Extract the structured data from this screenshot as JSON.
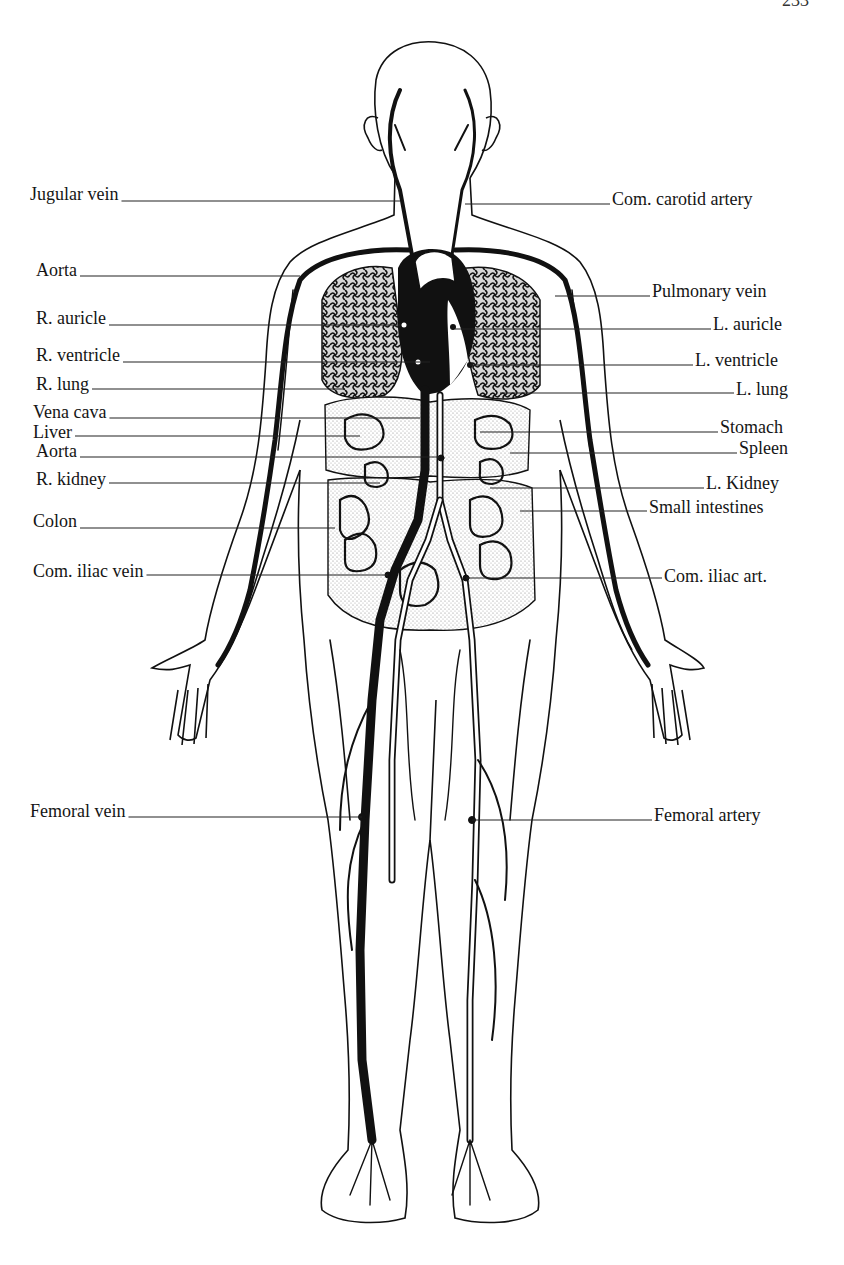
{
  "page": {
    "page_number_partial": "233"
  },
  "diagram": {
    "labels_left": [
      {
        "id": "jugular-vein",
        "text": "Jugular vein",
        "x": 30,
        "y": 184,
        "line_y": 201,
        "line_end_x": 400
      },
      {
        "id": "aorta-upper",
        "text": "Aorta",
        "x": 36,
        "y": 260,
        "line_y": 276,
        "line_end_x": 300
      },
      {
        "id": "r-auricle",
        "text": "R. auricle",
        "x": 36,
        "y": 308,
        "line_y": 325,
        "line_end_x": 400
      },
      {
        "id": "r-ventricle",
        "text": "R. ventricle",
        "x": 36,
        "y": 345,
        "line_y": 362,
        "line_end_x": 430
      },
      {
        "id": "r-lung",
        "text": "R. lung",
        "x": 36,
        "y": 374,
        "line_y": 389,
        "line_end_x": 345
      },
      {
        "id": "vena-cava",
        "text": "Vena cava",
        "x": 33,
        "y": 402,
        "line_y": 418,
        "line_end_x": 420
      },
      {
        "id": "liver",
        "text": "Liver",
        "x": 33,
        "y": 422,
        "line_y": 436,
        "line_end_x": 360
      },
      {
        "id": "aorta-lower",
        "text": "Aorta",
        "x": 36,
        "y": 441,
        "line_y": 457,
        "line_end_x": 440
      },
      {
        "id": "r-kidney",
        "text": "R. kidney",
        "x": 36,
        "y": 469,
        "line_y": 483,
        "line_end_x": 380
      },
      {
        "id": "colon",
        "text": "Colon",
        "x": 33,
        "y": 511,
        "line_y": 528,
        "line_end_x": 335
      },
      {
        "id": "com-iliac-vein",
        "text": "Com. iliac vein",
        "x": 33,
        "y": 561,
        "line_y": 575,
        "line_end_x": 388
      },
      {
        "id": "femoral-vein",
        "text": "Femoral vein",
        "x": 30,
        "y": 801,
        "line_y": 817,
        "line_end_x": 362
      }
    ],
    "labels_right": [
      {
        "id": "com-carotid-artery",
        "text": "Com. carotid artery",
        "x": 612,
        "y": 189,
        "line_y": 204,
        "line_start_x": 465
      },
      {
        "id": "pulmonary-vein",
        "text": "Pulmonary vein",
        "x": 652,
        "y": 281,
        "line_y": 296,
        "line_start_x": 555
      },
      {
        "id": "l-auricle",
        "text": "L. auricle",
        "x": 713,
        "y": 314,
        "line_y": 329,
        "line_start_x": 455
      },
      {
        "id": "l-ventricle",
        "text": "L. ventricle",
        "x": 695,
        "y": 350,
        "line_y": 365,
        "line_start_x": 470
      },
      {
        "id": "l-lung",
        "text": "L. lung",
        "x": 736,
        "y": 379,
        "line_y": 393,
        "line_start_x": 500
      },
      {
        "id": "stomach",
        "text": "Stomach",
        "x": 720,
        "y": 417,
        "line_y": 432,
        "line_start_x": 480
      },
      {
        "id": "spleen",
        "text": "Spleen",
        "x": 739,
        "y": 438,
        "line_y": 453,
        "line_start_x": 510
      },
      {
        "id": "l-kidney",
        "text": "L. Kidney",
        "x": 706,
        "y": 473,
        "line_y": 488,
        "line_start_x": 490
      },
      {
        "id": "small-intestines",
        "text": "Small intestines",
        "x": 649,
        "y": 497,
        "line_y": 511,
        "line_start_x": 520
      },
      {
        "id": "com-iliac-art",
        "text": "Com. iliac art.",
        "x": 664,
        "y": 566,
        "line_y": 578,
        "line_start_x": 466
      },
      {
        "id": "femoral-artery",
        "text": "Femoral artery",
        "x": 654,
        "y": 805,
        "line_y": 820,
        "line_start_x": 472
      }
    ]
  },
  "colors": {
    "background": "#ffffff",
    "ink": "#111111",
    "stipple": "#b8b8b8"
  }
}
